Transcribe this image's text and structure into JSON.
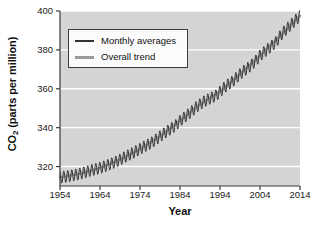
{
  "chart_data": {
    "type": "line",
    "title": "",
    "xlabel": "Year",
    "ylabel": "CO2 (parts per million)",
    "ylabel_main": "CO",
    "ylabel_sub": "2",
    "ylabel_rest": " (parts per million)",
    "xlim": [
      1954,
      2014
    ],
    "ylim": [
      310,
      400
    ],
    "xticks": [
      1954,
      1964,
      1974,
      1984,
      1994,
      2004,
      2014
    ],
    "yticks": [
      320,
      340,
      360,
      380,
      400
    ],
    "grid": "horizontal-white-gridlines",
    "plot_background": "#d4d4d4",
    "gridline_color": "#ffffff",
    "legend_position": "upper-left-inside",
    "legend": [
      {
        "label": "Monthly averages",
        "color": "#333333"
      },
      {
        "label": "Overall trend",
        "color": "#9a9a9a"
      }
    ],
    "series": [
      {
        "name": "Overall trend",
        "color": "#9a9a9a",
        "x": [
          1954,
          1959,
          1964,
          1969,
          1974,
          1979,
          1984,
          1989,
          1994,
          1999,
          2004,
          2009,
          2014
        ],
        "values": [
          314.5,
          316.3,
          319.3,
          323.5,
          329.0,
          335.5,
          343.5,
          352.0,
          358.5,
          367.5,
          377.0,
          387.0,
          397.5
        ]
      },
      {
        "name": "Monthly averages",
        "color": "#333333",
        "description": "Annual sawtooth oscillation of about +/- 3 ppm superimposed on the rising trend",
        "seasonal_amplitude": 3.0,
        "x": [
          1954,
          1955,
          1956,
          1957,
          1958,
          1959,
          1960,
          1961,
          1962,
          1963,
          1964,
          1965,
          1966,
          1967,
          1968,
          1969,
          1970,
          1971,
          1972,
          1973,
          1974,
          1975,
          1976,
          1977,
          1978,
          1979,
          1980,
          1981,
          1982,
          1983,
          1984,
          1985,
          1986,
          1987,
          1988,
          1989,
          1990,
          1991,
          1992,
          1993,
          1994,
          1995,
          1996,
          1997,
          1998,
          1999,
          2000,
          2001,
          2002,
          2003,
          2004,
          2005,
          2006,
          2007,
          2008,
          2009,
          2010,
          2011,
          2012,
          2013,
          2014
        ],
        "values": [
          314.4,
          314.7,
          315.0,
          315.4,
          315.8,
          316.3,
          316.9,
          317.5,
          318.2,
          318.7,
          319.3,
          320.0,
          320.8,
          321.6,
          322.5,
          323.5,
          324.7,
          325.7,
          326.8,
          327.9,
          329.0,
          330.2,
          331.3,
          332.4,
          333.9,
          335.5,
          337.0,
          338.5,
          339.8,
          341.3,
          343.5,
          345.2,
          346.8,
          348.5,
          350.5,
          352.0,
          353.5,
          354.5,
          355.5,
          356.5,
          358.5,
          360.5,
          362.2,
          363.5,
          365.5,
          367.5,
          369.2,
          370.7,
          372.5,
          374.5,
          377.0,
          378.8,
          380.5,
          382.2,
          384.0,
          387.0,
          389.5,
          391.5,
          393.5,
          395.5,
          397.5
        ]
      }
    ]
  },
  "xticks_labels": [
    "1954",
    "1964",
    "1974",
    "1984",
    "1994",
    "2004",
    "2014"
  ],
  "yticks_labels": [
    "400",
    "380",
    "360",
    "340",
    "320"
  ]
}
